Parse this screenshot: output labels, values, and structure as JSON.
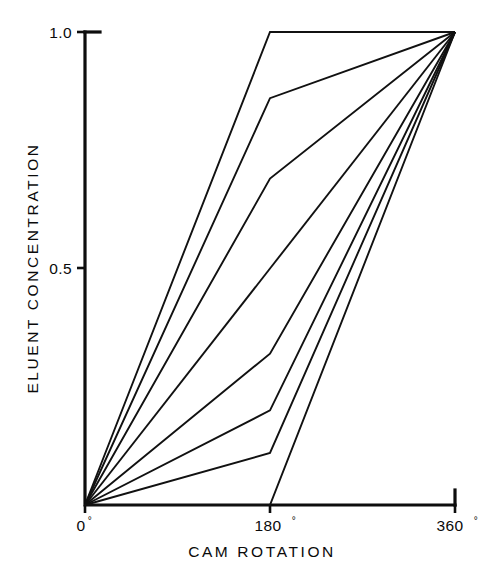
{
  "chart_data": {
    "type": "line",
    "title": "",
    "subtitle": "",
    "xlabel": "CAM ROTATION",
    "ylabel": "ELUENT CONCENTRATION",
    "xlim": [
      0,
      360
    ],
    "ylim": [
      0,
      1.0
    ],
    "grid": false,
    "legend": "none",
    "x_tick_values": [
      0,
      180,
      360
    ],
    "x_tick_labels": [
      "0°",
      "180°",
      "360°"
    ],
    "y_tick_values": [
      0.5,
      1.0
    ],
    "y_tick_labels": [
      "0.5",
      "1.0"
    ],
    "x": [
      0,
      180,
      360
    ],
    "annotations": [],
    "series": [
      {
        "name": "cam-profile-1",
        "values": [
          0.0,
          1.0,
          1.0
        ]
      },
      {
        "name": "cam-profile-2",
        "values": [
          0.0,
          0.86,
          1.0
        ]
      },
      {
        "name": "cam-profile-3",
        "values": [
          0.0,
          0.69,
          1.0
        ]
      },
      {
        "name": "cam-profile-4",
        "values": [
          0.0,
          0.5,
          1.0
        ]
      },
      {
        "name": "cam-profile-5",
        "values": [
          0.0,
          0.32,
          1.0
        ]
      },
      {
        "name": "cam-profile-6",
        "values": [
          0.0,
          0.2,
          1.0
        ]
      },
      {
        "name": "cam-profile-7",
        "values": [
          0.0,
          0.11,
          1.0
        ]
      },
      {
        "name": "cam-profile-8",
        "values": [
          0.0,
          0.0,
          1.0
        ]
      }
    ]
  },
  "axis": {
    "y_top_label": "1.0",
    "y_mid_label": "0.5",
    "x_start_label": "0",
    "x_start_degree": "°",
    "x_mid_label": "180",
    "x_mid_degree": "°",
    "x_end_label": "360",
    "x_end_degree": "°",
    "x_title": "CAM ROTATION",
    "y_title": "ELUENT CONCENTRATION"
  },
  "colors": {
    "ink": "#0d0d0d",
    "background": "#ffffff",
    "series_stroke": "#111111"
  }
}
